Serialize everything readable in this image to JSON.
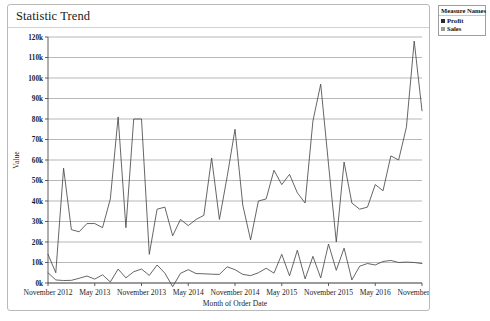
{
  "panel": {
    "title": "Statistic Trend"
  },
  "legend": {
    "title": "Measure Names",
    "items": [
      {
        "label": "Profit",
        "color": "#2b2b2b"
      },
      {
        "label": "Sales",
        "color": "#9c9c9c"
      }
    ]
  },
  "chart_data": {
    "type": "line",
    "title": "Statistic Trend",
    "xlabel": "Month of Order Date",
    "ylabel": "Value",
    "grid": true,
    "legend_position": "right-outside",
    "ylim": [
      0,
      120000
    ],
    "ytick_values": [
      0,
      10000,
      20000,
      30000,
      40000,
      50000,
      60000,
      70000,
      80000,
      90000,
      100000,
      110000,
      120000
    ],
    "ytick_labels": [
      "0k",
      "10k",
      "20k",
      "30k",
      "40k",
      "50k",
      "60k",
      "70k",
      "80k",
      "90k",
      "100k",
      "110k",
      "120k"
    ],
    "xtick_labels": [
      "November 2012",
      "May 2013",
      "November 2013",
      "May 2014",
      "November 2014",
      "May 2015",
      "November 2015",
      "May 2016",
      "November 2016"
    ],
    "xtick_indices": [
      0,
      6,
      12,
      18,
      24,
      30,
      36,
      42,
      48
    ],
    "x": [
      "November 2012",
      "December 2012",
      "January 2013",
      "February 2013",
      "March 2013",
      "April 2013",
      "May 2013",
      "June 2013",
      "July 2013",
      "August 2013",
      "September 2013",
      "October 2013",
      "November 2013",
      "December 2013",
      "January 2014",
      "February 2014",
      "March 2014",
      "April 2014",
      "May 2014",
      "June 2014",
      "July 2014",
      "August 2014",
      "September 2014",
      "October 2014",
      "November 2014",
      "December 2014",
      "January 2015",
      "February 2015",
      "March 2015",
      "April 2015",
      "May 2015",
      "June 2015",
      "July 2015",
      "August 2015",
      "September 2015",
      "October 2015",
      "November 2015",
      "December 2015",
      "January 2016",
      "February 2016",
      "March 2016",
      "April 2016",
      "May 2016",
      "June 2016",
      "July 2016",
      "August 2016",
      "September 2016",
      "October 2016",
      "November 2016"
    ],
    "series": [
      {
        "name": "Sales",
        "color": "#4a4a4a",
        "values": [
          14000,
          5000,
          56000,
          26000,
          25000,
          29000,
          29000,
          27000,
          41000,
          81000,
          27000,
          80000,
          80000,
          14000,
          36000,
          37000,
          23000,
          31000,
          28000,
          31000,
          33000,
          61000,
          31000,
          52000,
          75000,
          38000,
          21000,
          40000,
          41000,
          55000,
          48000,
          53000,
          44000,
          39000,
          79000,
          97000,
          58000,
          20000,
          59000,
          39000,
          36000,
          37000,
          48000,
          45000,
          62000,
          60000,
          76000,
          118000,
          84000
        ]
      },
      {
        "name": "Profit",
        "color": "#4a4a4a",
        "values": [
          5000,
          1500,
          1200,
          1300,
          2300,
          3400,
          1900,
          4000,
          500,
          6800,
          2500,
          5500,
          6800,
          3700,
          8800,
          4800,
          -1800,
          4700,
          6500,
          4600,
          4500,
          4300,
          4200,
          7900,
          6500,
          4200,
          3600,
          5000,
          7200,
          4800,
          14000,
          3500,
          16000,
          2000,
          13000,
          2500,
          19000,
          6200,
          17000,
          1500,
          8200,
          9500,
          8800,
          10500,
          11000,
          10000,
          10200,
          10000,
          9500
        ]
      }
    ]
  }
}
